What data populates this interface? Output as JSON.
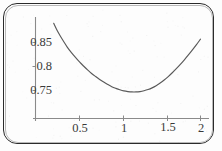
{
  "figure": {
    "kind": "scanned-function-plot",
    "background_color": "#fdfdfd",
    "frame_color": "#2b2b2b",
    "curve_color": "#595959",
    "axis_color": "#8a8a8a",
    "label_color": "#3a3a3a"
  },
  "chart_data": {
    "type": "line",
    "title": "",
    "subtitle": "",
    "xlabel": "",
    "ylabel": "",
    "grid": false,
    "legend": null,
    "xlim": [
      0.12,
      2.08
    ],
    "ylim": [
      0.718,
      0.895
    ],
    "xticks": [
      0.5,
      1,
      1.5,
      2
    ],
    "xtick_labels": [
      "0.5",
      "1",
      "1.5",
      "2"
    ],
    "yticks": [
      0.75,
      0.8,
      0.85
    ],
    "ytick_labels": [
      "0.75",
      "0.8",
      "0.85"
    ],
    "axis_origin_value": 0.7255,
    "minimum": {
      "x": 1.05,
      "y": 0.7235
    },
    "series": [
      {
        "name": "curve",
        "x": [
          0.18,
          0.22,
          0.26,
          0.3,
          0.35,
          0.4,
          0.45,
          0.5,
          0.55,
          0.6,
          0.65,
          0.7,
          0.75,
          0.8,
          0.85,
          0.9,
          0.95,
          1.0,
          1.05,
          1.1,
          1.15,
          1.2,
          1.25,
          1.3,
          1.35,
          1.4,
          1.45,
          1.5,
          1.55,
          1.6,
          1.65,
          1.7,
          1.75,
          1.8,
          1.85,
          1.9,
          1.95,
          2.0
        ],
        "y": [
          0.89,
          0.876,
          0.864,
          0.853,
          0.84,
          0.829,
          0.819,
          0.8095,
          0.801,
          0.793,
          0.7855,
          0.779,
          0.773,
          0.7675,
          0.7625,
          0.758,
          0.7545,
          0.7515,
          0.7492,
          0.7478,
          0.747,
          0.747,
          0.7478,
          0.7495,
          0.752,
          0.7555,
          0.76,
          0.7655,
          0.7718,
          0.779,
          0.787,
          0.7955,
          0.8045,
          0.814,
          0.824,
          0.8345,
          0.8455,
          0.857
        ]
      }
    ]
  },
  "axes": {
    "y_axis_name": "vertical-axis-line",
    "x_axis_name": "horizontal-axis-line"
  }
}
